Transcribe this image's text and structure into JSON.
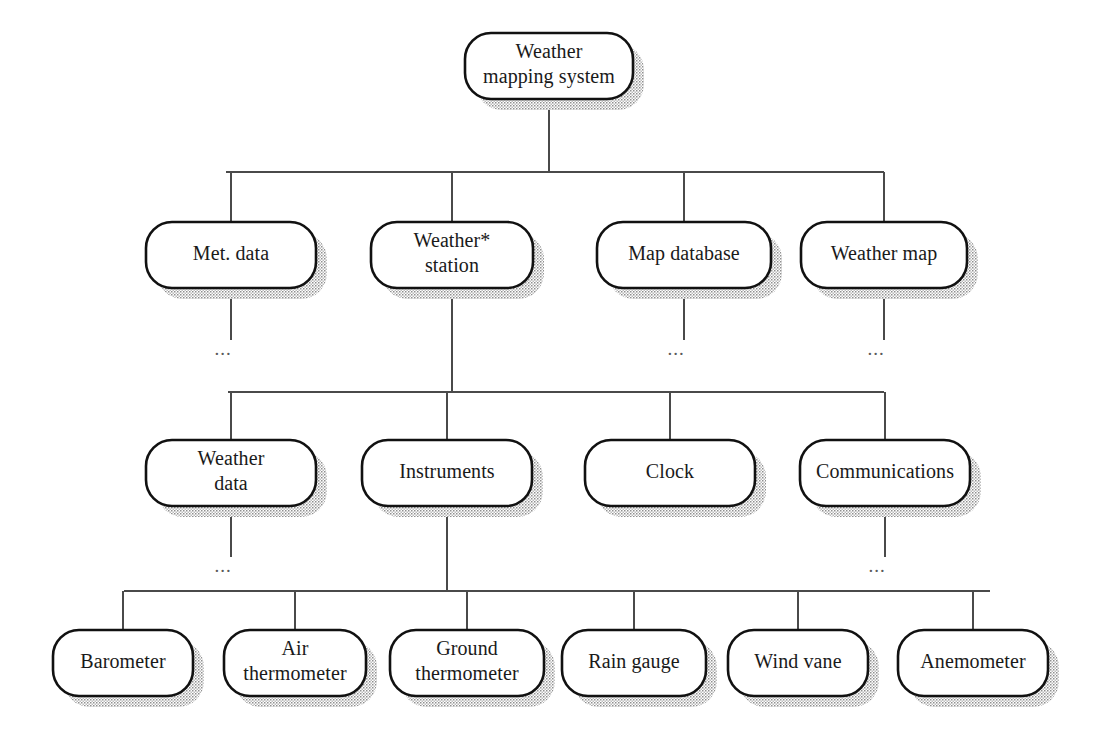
{
  "diagram": {
    "type": "hierarchy-decomposition-tree",
    "ellipsis_marker": "...",
    "colors": {
      "node_fill": "#ffffff",
      "node_stroke": "#111111",
      "connector": "#4a4a4a",
      "shadow": "#9a9a9a",
      "text": "#1a1a1a",
      "background": "#ffffff"
    },
    "levels": [
      {
        "level": 1,
        "name": "root",
        "nodes": [
          {
            "id": "weather-mapping-system",
            "lines": [
              "Weather",
              "mapping system"
            ]
          }
        ]
      },
      {
        "level": 2,
        "name": "subsystems",
        "nodes": [
          {
            "id": "met-data",
            "lines": [
              "Met. data"
            ],
            "ellipsis": true
          },
          {
            "id": "weather-station",
            "lines": [
              "Weather*",
              "station"
            ],
            "ellipsis": false
          },
          {
            "id": "map-database",
            "lines": [
              "Map database"
            ],
            "ellipsis": true
          },
          {
            "id": "weather-map",
            "lines": [
              "Weather map"
            ],
            "ellipsis": true
          }
        ]
      },
      {
        "level": 3,
        "name": "weather-station-components",
        "nodes": [
          {
            "id": "weather-data",
            "lines": [
              "Weather",
              "data"
            ],
            "ellipsis": true
          },
          {
            "id": "instruments",
            "lines": [
              "Instruments"
            ],
            "ellipsis": false
          },
          {
            "id": "clock",
            "lines": [
              "Clock"
            ],
            "ellipsis": false
          },
          {
            "id": "communications",
            "lines": [
              "Communications"
            ],
            "ellipsis": true
          }
        ]
      },
      {
        "level": 4,
        "name": "instrument-components",
        "nodes": [
          {
            "id": "barometer",
            "lines": [
              "Barometer"
            ],
            "ellipsis": false
          },
          {
            "id": "air-thermometer",
            "lines": [
              "Air",
              "thermometer"
            ],
            "ellipsis": false
          },
          {
            "id": "ground-thermometer",
            "lines": [
              "Ground",
              "thermometer"
            ],
            "ellipsis": false
          },
          {
            "id": "rain-gauge",
            "lines": [
              "Rain gauge"
            ],
            "ellipsis": false
          },
          {
            "id": "wind-vane",
            "lines": [
              "Wind vane"
            ],
            "ellipsis": false
          },
          {
            "id": "anemometer",
            "lines": [
              "Anemometer"
            ],
            "ellipsis": false
          }
        ]
      }
    ],
    "edges": [
      {
        "from": "weather-mapping-system",
        "to": "met-data"
      },
      {
        "from": "weather-mapping-system",
        "to": "weather-station"
      },
      {
        "from": "weather-mapping-system",
        "to": "map-database"
      },
      {
        "from": "weather-mapping-system",
        "to": "weather-map"
      },
      {
        "from": "weather-station",
        "to": "weather-data"
      },
      {
        "from": "weather-station",
        "to": "instruments"
      },
      {
        "from": "weather-station",
        "to": "clock"
      },
      {
        "from": "weather-station",
        "to": "communications"
      },
      {
        "from": "instruments",
        "to": "barometer"
      },
      {
        "from": "instruments",
        "to": "air-thermometer"
      },
      {
        "from": "instruments",
        "to": "ground-thermometer"
      },
      {
        "from": "instruments",
        "to": "rain-gauge"
      },
      {
        "from": "instruments",
        "to": "wind-vane"
      },
      {
        "from": "instruments",
        "to": "anemometer"
      }
    ],
    "geometry": {
      "canvas": {
        "width": 1103,
        "height": 756
      },
      "shadow_offset": {
        "x": 11,
        "y": 11
      },
      "corner_radius": 26,
      "rows": [
        {
          "level": 1,
          "y": 33,
          "height": 66,
          "bus_y": 172,
          "boxes": [
            {
              "id": "weather-mapping-system",
              "x": 465,
              "w": 168
            }
          ]
        },
        {
          "level": 2,
          "y": 222,
          "height": 66,
          "bus_y": 392,
          "boxes": [
            {
              "id": "met-data",
              "x": 146,
              "w": 170
            },
            {
              "id": "weather-station",
              "x": 371,
              "w": 162
            },
            {
              "id": "map-database",
              "x": 597,
              "w": 174
            },
            {
              "id": "weather-map",
              "x": 801,
              "w": 166
            }
          ],
          "ellipsis_y": 355,
          "stub_bottom": 340
        },
        {
          "level": 3,
          "y": 440,
          "height": 66,
          "bus_y": 591,
          "boxes": [
            {
              "id": "weather-data",
              "x": 146,
              "w": 170
            },
            {
              "id": "instruments",
              "x": 362,
              "w": 170
            },
            {
              "id": "clock",
              "x": 585,
              "w": 170
            },
            {
              "id": "communications",
              "x": 800,
              "w": 170
            }
          ],
          "ellipsis_y": 572,
          "stub_bottom": 557
        },
        {
          "level": 4,
          "y": 630,
          "height": 66,
          "bus_y": null,
          "boxes": [
            {
              "id": "barometer",
              "x": 53,
              "w": 140
            },
            {
              "id": "air-thermometer",
              "x": 224,
              "w": 142
            },
            {
              "id": "ground-thermometer",
              "x": 390,
              "w": 154
            },
            {
              "id": "rain-gauge",
              "x": 562,
              "w": 144
            },
            {
              "id": "wind-vane",
              "x": 728,
              "w": 140
            },
            {
              "id": "anemometer",
              "x": 898,
              "w": 150
            }
          ]
        }
      ],
      "buses": [
        {
          "id": "bus-level2",
          "y": 172,
          "x1": 226,
          "x2": 884,
          "parent_x": 549,
          "parent_bottom": 99
        },
        {
          "id": "bus-level3",
          "y": 392,
          "x1": 228,
          "x2": 884,
          "parent_x": 452,
          "parent_bottom": 288
        },
        {
          "id": "bus-level4",
          "y": 591,
          "x1": 124,
          "x2": 990,
          "parent_x": 447,
          "parent_bottom": 506
        }
      ]
    }
  }
}
